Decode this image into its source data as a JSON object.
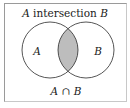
{
  "diagram": {
    "title": "A intersection B",
    "title_prefix": "A",
    "title_word": " intersection ",
    "title_suffix": "B",
    "set_a_label": "A",
    "set_b_label": "B",
    "caption": "A ∩ B",
    "caption_a": "A",
    "caption_op": " ∩ ",
    "caption_b": "B",
    "colors": {
      "shaded_region": "#bdbdbd",
      "outline": "#2a2a2a",
      "frame": "#9a9a9a",
      "background": "#ffffff"
    }
  }
}
